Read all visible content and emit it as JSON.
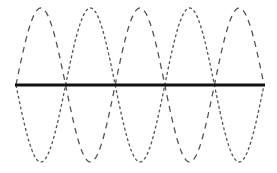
{
  "diagram": {
    "type": "standing-wave",
    "width": 277,
    "height": 173,
    "equilibrium_y": 85,
    "x_start": 16,
    "x_end": 264,
    "amplitude": 77,
    "loops": 5,
    "node_x": [
      16,
      65,
      115,
      165,
      214,
      264
    ],
    "colors": {
      "string": "#111111",
      "envelope": "#555555",
      "background": "#ffffff"
    },
    "curves": [
      {
        "name": "envelope-positive",
        "style": "long-dash",
        "sign": 1,
        "dasharray": "6,5"
      },
      {
        "name": "envelope-negative",
        "style": "short-dash",
        "sign": -1,
        "dasharray": "3,2.5"
      }
    ]
  }
}
